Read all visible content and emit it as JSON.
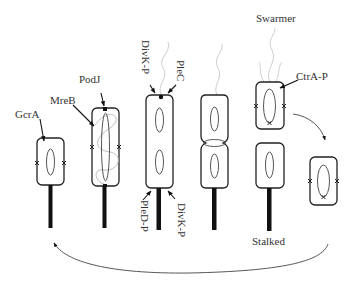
{
  "figure": {
    "type": "cell-cycle diagram"
  },
  "labels": {
    "gcra": "GcrA",
    "mreb": "MreB",
    "podj": "PodJ",
    "divk_top": "DivK-P",
    "plec": "PleC",
    "pled": "PleD-P",
    "divk_bottom": "DivK-P",
    "swarmer": "Swarmer",
    "ctra": "CtrA-P",
    "stalked": "Stalked"
  },
  "stages": [
    {
      "id": 1,
      "description": "stalked cell with GcrA, origin x-marks"
    },
    {
      "id": 2,
      "description": "elongating cell with MreB helix and PodJ at pole"
    },
    {
      "id": 3,
      "description": "predivisional cell with DivK-P and PleC at swarmer pole, PleD-P and DivK-P at stalked pole"
    },
    {
      "id": 4,
      "description": "constricting predivisional cell"
    },
    {
      "id": 5,
      "description": "divided swarmer (CtrA-P) and stalked daughter cells"
    },
    {
      "id": 6,
      "description": "swarmer differentiating into stalked cell"
    }
  ],
  "colors": {
    "outline": "#222222",
    "stalk": "#111111",
    "flagellum": "#cfcfcf",
    "mreb": "#b5b5b5",
    "text": "#333333"
  }
}
